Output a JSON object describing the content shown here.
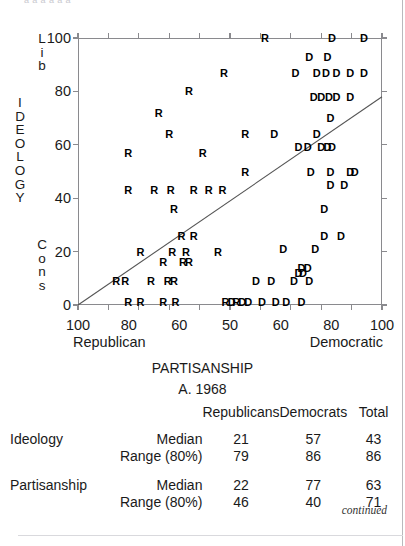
{
  "figure": {
    "top_clipped_text": "a a a a a a",
    "caption_main": "PARTISANSHIP",
    "caption_sub": "A. 1968",
    "continued_note": "continued"
  },
  "axes": {
    "y": {
      "vertical_title": "IDEOLOGY",
      "top_anchor": "Lib",
      "bottom_anchor": "Cons",
      "ticks": [
        0,
        20,
        40,
        60,
        80,
        100
      ],
      "min": 0,
      "max": 100
    },
    "x": {
      "title": "PARTISANSHIP",
      "left_anchor": "Republican",
      "right_anchor": "Democratic",
      "tick_labels": [
        "100",
        "80",
        "60",
        "50",
        "60",
        "80",
        "100"
      ],
      "min": 0,
      "max": 100
    }
  },
  "chart_data": {
    "type": "scatter",
    "title": "PARTISANSHIP",
    "subtitle": "A. 1968",
    "xlabel": "PARTISANSHIP",
    "ylabel": "IDEOLOGY",
    "xlim": [
      0,
      100
    ],
    "ylim": [
      0,
      100
    ],
    "grid": false,
    "legend": "none",
    "x_tick_values": [
      0,
      16.7,
      33.3,
      50,
      66.7,
      83.3,
      100
    ],
    "x_tick_labels": [
      "100",
      "80",
      "60",
      "50",
      "60",
      "80",
      "100"
    ],
    "y_tick_values": [
      0,
      20,
      40,
      60,
      80,
      100
    ],
    "y_tick_labels": [
      "0",
      "20",
      "40",
      "60",
      "80",
      "100"
    ],
    "x_axis_direction": "Republican (left) to Democratic (right)",
    "y_axis_direction": "Cons (bottom) to Lib (top)",
    "annotations": [
      {
        "text": "Lib",
        "position": "y-axis-top"
      },
      {
        "text": "Cons",
        "position": "y-axis-bottom"
      },
      {
        "text": "Republican",
        "position": "x-axis-left"
      },
      {
        "text": "Democratic",
        "position": "x-axis-right"
      }
    ],
    "trendline": {
      "x0": 0,
      "y0": 0,
      "x1": 100,
      "y1": 78
    },
    "series": [
      {
        "name": "R",
        "marker": "R",
        "color": "#000000",
        "points": [
          [
            61.5,
            100
          ],
          [
            48.0,
            87
          ],
          [
            36.5,
            80
          ],
          [
            26.5,
            72
          ],
          [
            55.0,
            64
          ],
          [
            30.0,
            64
          ],
          [
            16.5,
            57
          ],
          [
            41.0,
            57
          ],
          [
            55.0,
            50
          ],
          [
            16.5,
            43
          ],
          [
            25.0,
            43
          ],
          [
            30.5,
            43
          ],
          [
            38.0,
            43
          ],
          [
            43.0,
            43
          ],
          [
            47.5,
            43
          ],
          [
            31.5,
            36
          ],
          [
            34.0,
            26
          ],
          [
            38.0,
            26
          ],
          [
            20.5,
            20
          ],
          [
            31.0,
            20
          ],
          [
            35.5,
            20
          ],
          [
            46.0,
            20
          ],
          [
            28.0,
            16
          ],
          [
            34.5,
            16
          ],
          [
            36.5,
            16
          ],
          [
            12.5,
            9
          ],
          [
            15.5,
            9
          ],
          [
            24.0,
            9
          ],
          [
            29.5,
            9
          ],
          [
            31.5,
            9
          ],
          [
            16.5,
            1
          ],
          [
            20.5,
            1
          ],
          [
            28.0,
            1
          ],
          [
            32.0,
            1
          ],
          [
            48.5,
            1
          ],
          [
            52.0,
            1
          ]
        ]
      },
      {
        "name": "D",
        "marker": "D",
        "color": "#000000",
        "points": [
          [
            83.5,
            100
          ],
          [
            94.0,
            100
          ],
          [
            76.0,
            93
          ],
          [
            82.0,
            93
          ],
          [
            71.5,
            87
          ],
          [
            78.5,
            87
          ],
          [
            81.5,
            87
          ],
          [
            85.0,
            87
          ],
          [
            89.5,
            87
          ],
          [
            94.0,
            87
          ],
          [
            77.5,
            78
          ],
          [
            80.0,
            78
          ],
          [
            82.5,
            78
          ],
          [
            85.0,
            78
          ],
          [
            89.5,
            78
          ],
          [
            83.0,
            70
          ],
          [
            64.5,
            64
          ],
          [
            78.5,
            64
          ],
          [
            72.5,
            59
          ],
          [
            75.5,
            59
          ],
          [
            80.0,
            59
          ],
          [
            82.0,
            59
          ],
          [
            83.5,
            59
          ],
          [
            76.5,
            50
          ],
          [
            83.0,
            50
          ],
          [
            89.5,
            50
          ],
          [
            91.0,
            50
          ],
          [
            83.0,
            45
          ],
          [
            87.5,
            45
          ],
          [
            81.0,
            36
          ],
          [
            81.0,
            26
          ],
          [
            86.5,
            26
          ],
          [
            67.5,
            21
          ],
          [
            78.0,
            21
          ],
          [
            73.5,
            14
          ],
          [
            75.5,
            14
          ],
          [
            72.5,
            12
          ],
          [
            74.0,
            12
          ],
          [
            58.5,
            9
          ],
          [
            63.5,
            9
          ],
          [
            71.0,
            9
          ],
          [
            76.0,
            9
          ],
          [
            50.5,
            1
          ],
          [
            54.0,
            1
          ],
          [
            56.0,
            1
          ],
          [
            60.5,
            1
          ],
          [
            65.0,
            1
          ],
          [
            68.5,
            1
          ],
          [
            73.5,
            1
          ]
        ]
      }
    ]
  },
  "table": {
    "column_headers": [
      "Republicans",
      "Democrats",
      "Total"
    ],
    "rows": [
      {
        "group": "Ideology",
        "stat": "Median",
        "republicans": "21",
        "democrats": "57",
        "total": "43"
      },
      {
        "group": "",
        "stat": "Range (80%)",
        "republicans": "79",
        "democrats": "86",
        "total": "86"
      },
      {
        "group": "Partisanship",
        "stat": "Median",
        "republicans": "22",
        "democrats": "77",
        "total": "63"
      },
      {
        "group": "",
        "stat": "Range (80%)",
        "republicans": "46",
        "democrats": "40",
        "total": "71"
      }
    ]
  }
}
